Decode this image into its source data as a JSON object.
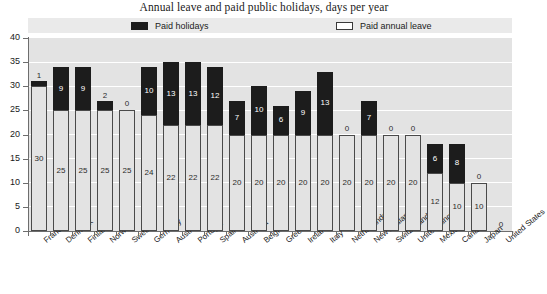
{
  "title": "Annual leave and paid public holidays, days per year",
  "legend": {
    "holidays_label": "Paid holidays",
    "annual_label": "Paid annual leave",
    "holidays_color": "#1c1c1c",
    "annual_color": "#ffffff"
  },
  "axis": {
    "y_ticks": [
      "0",
      "5",
      "10",
      "15",
      "20",
      "25",
      "30",
      "35",
      "40"
    ]
  },
  "chart_data": {
    "type": "bar",
    "title": "Annual leave and paid public holidays, days per year",
    "subtitle": "",
    "xlabel": "",
    "ylabel": "",
    "ylim": [
      0,
      40
    ],
    "ytick_step": 5,
    "grid": true,
    "stacked": true,
    "legend_position": "top",
    "categories": [
      "France",
      "Denmark",
      "Finland",
      "Norway",
      "Sweden",
      "Germany",
      "Austria",
      "Portugal",
      "Spain",
      "Australia",
      "Belgium",
      "Greece",
      "Ireland",
      "Italy",
      "Netherlands",
      "New Zealand",
      "Switzerland",
      "United Kingdom",
      "Mexico",
      "Canada",
      "Japan",
      "United States"
    ],
    "series": [
      {
        "name": "Paid annual leave",
        "color": "#ffffff",
        "values": [
          30,
          25,
          25,
          25,
          25,
          24,
          22,
          22,
          22,
          20,
          20,
          20,
          20,
          20,
          20,
          20,
          20,
          20,
          12,
          10,
          10,
          0
        ]
      },
      {
        "name": "Paid holidays",
        "color": "#1c1c1c",
        "values": [
          1,
          9,
          9,
          2,
          0,
          10,
          13,
          13,
          12,
          7,
          10,
          6,
          9,
          13,
          0,
          7,
          0,
          0,
          6,
          8,
          0,
          0
        ]
      }
    ],
    "totals": [
      31,
      34,
      34,
      27,
      25,
      34,
      35,
      35,
      34,
      27,
      30,
      26,
      29,
      33,
      20,
      27,
      20,
      20,
      18,
      18,
      10,
      0
    ]
  }
}
